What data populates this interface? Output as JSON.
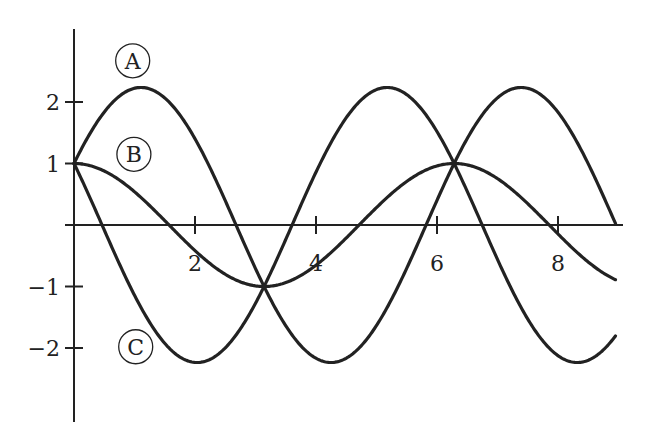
{
  "chart_data": {
    "type": "line",
    "title": "",
    "xlabel": "",
    "ylabel": "",
    "xlim": [
      -0.15,
      9.1
    ],
    "ylim": [
      -3.2,
      3.2
    ],
    "grid": false,
    "legend": "inline circled letters",
    "x_ticks": [
      2,
      4,
      6,
      8
    ],
    "x_tick_labels": [
      "2",
      "4",
      "6",
      "8"
    ],
    "y_ticks": [
      2,
      1,
      -1,
      -2
    ],
    "y_tick_labels": [
      "2",
      "1",
      "−1",
      "−2"
    ],
    "x_domain": [
      0,
      8.95
    ],
    "series": [
      {
        "name": "A",
        "formula": "cos(x) + 2 sin(x)",
        "a": 1,
        "b": 2,
        "sample_points": [
          [
            0,
            1
          ],
          [
            1.107,
            2.236
          ],
          [
            2.678,
            0
          ],
          [
            4.249,
            -2.236
          ],
          [
            5.82,
            0
          ],
          [
            7.39,
            2.236
          ],
          [
            8.96,
            0
          ]
        ]
      },
      {
        "name": "B",
        "formula": "cos(x)",
        "a": 1,
        "b": 0,
        "sample_points": [
          [
            0,
            1
          ],
          [
            1.571,
            0
          ],
          [
            3.1416,
            -1
          ],
          [
            4.712,
            0
          ],
          [
            6.283,
            1
          ],
          [
            7.854,
            0
          ],
          [
            8.95,
            -0.88
          ]
        ]
      },
      {
        "name": "C",
        "formula": "cos(x) - 2 sin(x)",
        "a": 1,
        "b": -2,
        "sample_points": [
          [
            0,
            1
          ],
          [
            0.464,
            0
          ],
          [
            2.034,
            -2.236
          ],
          [
            3.605,
            0
          ],
          [
            5.176,
            2.236
          ],
          [
            6.747,
            0
          ],
          [
            8.318,
            -2.236
          ],
          [
            8.95,
            -1.7
          ]
        ]
      }
    ],
    "labels": [
      {
        "text": "A",
        "x": 0.97,
        "y": 2.67
      },
      {
        "text": "B",
        "x": 0.99,
        "y": 1.15
      },
      {
        "text": "C",
        "x": 1.02,
        "y": -1.98
      }
    ]
  },
  "layout": {
    "origin_px": [
      74,
      225
    ],
    "x_scale_px": 60.5,
    "y_scale_px": 61.5,
    "x_axis_px": [
      65,
      623
    ],
    "y_axis_px": [
      29,
      422
    ],
    "line_color": "#222222",
    "curve_width": 3.2,
    "axis_width": 2
  }
}
